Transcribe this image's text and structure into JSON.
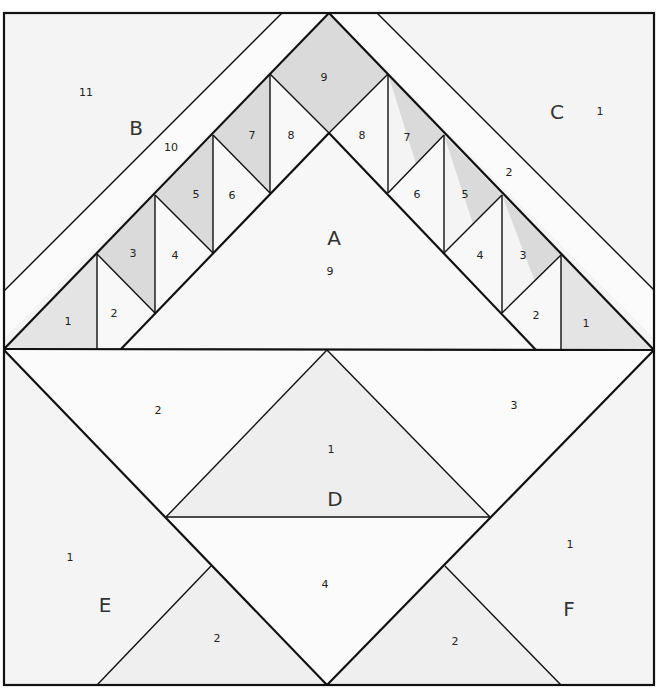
{
  "diagram": {
    "type": "quilt-block-paper-piecing-pattern",
    "colors": {
      "background": "#f4f4f4",
      "band": "#fbfbfb",
      "shade_light": "#e6e6e6",
      "shade": "#dadada",
      "line": "#111111"
    },
    "sections": {
      "A": {
        "label": "A",
        "pieces": [
          {
            "id": "9",
            "label": "9"
          }
        ]
      },
      "B": {
        "label": "B",
        "pieces": [
          {
            "id": "1",
            "label": "1"
          },
          {
            "id": "2",
            "label": "2"
          },
          {
            "id": "3",
            "label": "3"
          },
          {
            "id": "4",
            "label": "4"
          },
          {
            "id": "5",
            "label": "5"
          },
          {
            "id": "6",
            "label": "6"
          },
          {
            "id": "7",
            "label": "7"
          },
          {
            "id": "8",
            "label": "8"
          },
          {
            "id": "9",
            "label": "9"
          },
          {
            "id": "10",
            "label": "10"
          },
          {
            "id": "11",
            "label": "11"
          }
        ]
      },
      "C": {
        "label": "C",
        "pieces": [
          {
            "id": "1",
            "label": "1"
          },
          {
            "id": "2",
            "label": "2"
          },
          {
            "id": "3",
            "label": "3"
          },
          {
            "id": "4",
            "label": "4"
          },
          {
            "id": "5",
            "label": "5"
          },
          {
            "id": "6",
            "label": "6"
          },
          {
            "id": "7",
            "label": "7"
          },
          {
            "id": "8",
            "label": "8"
          },
          {
            "id": "c1",
            "label": "1"
          },
          {
            "id": "c2",
            "label": "2"
          }
        ]
      },
      "D": {
        "label": "D",
        "pieces": [
          {
            "id": "1",
            "label": "1"
          },
          {
            "id": "2",
            "label": "2"
          },
          {
            "id": "3",
            "label": "3"
          },
          {
            "id": "4",
            "label": "4"
          }
        ]
      },
      "E": {
        "label": "E",
        "pieces": [
          {
            "id": "1",
            "label": "1"
          },
          {
            "id": "2",
            "label": "2"
          }
        ]
      },
      "F": {
        "label": "F",
        "pieces": [
          {
            "id": "1",
            "label": "1"
          },
          {
            "id": "2",
            "label": "2"
          }
        ]
      }
    }
  }
}
